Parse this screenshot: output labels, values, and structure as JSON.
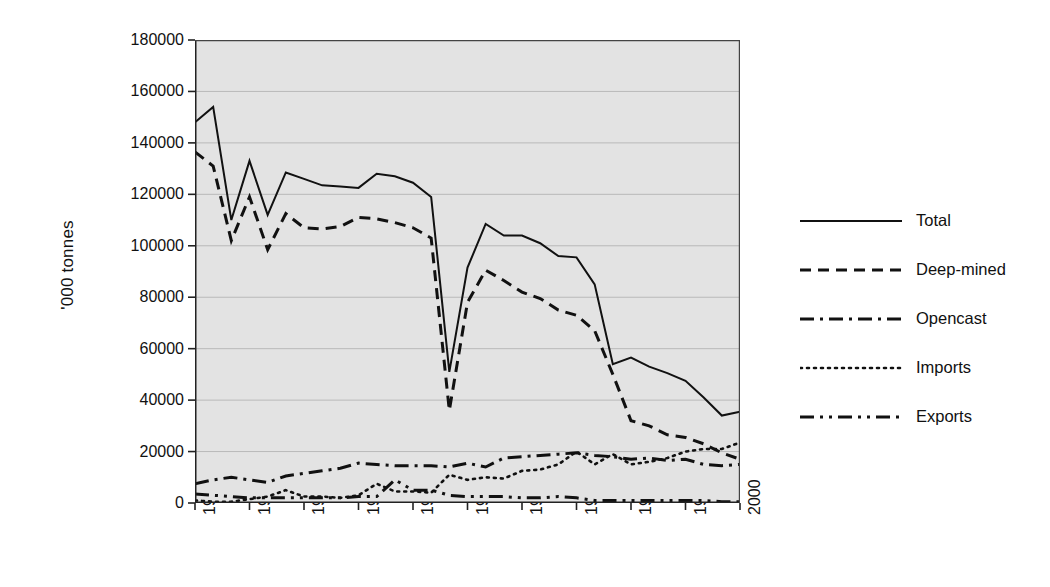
{
  "chart_data": {
    "type": "line",
    "title": "",
    "xlabel": "",
    "ylabel": "'000 tonnes",
    "ylim": [
      0,
      180000
    ],
    "xlim": [
      1970,
      2000
    ],
    "ytick_labels": [
      "180000",
      "160000",
      "140000",
      "120000",
      "100000",
      "80000",
      "60000",
      "40000",
      "20000",
      "0"
    ],
    "ytick_values": [
      180000,
      160000,
      140000,
      120000,
      100000,
      80000,
      60000,
      40000,
      20000,
      0
    ],
    "xtick_labels": [
      "1970",
      "1973",
      "1976",
      "1979",
      "1982",
      "1985",
      "1988",
      "1991",
      "1994",
      "1997",
      "2000"
    ],
    "xtick_values": [
      1970,
      1973,
      1976,
      1979,
      1982,
      1985,
      1988,
      1991,
      1994,
      1997,
      2000
    ],
    "x": [
      1970,
      1971,
      1972,
      1973,
      1974,
      1975,
      1976,
      1977,
      1978,
      1979,
      1980,
      1981,
      1982,
      1983,
      1984,
      1985,
      1986,
      1987,
      1988,
      1989,
      1990,
      1991,
      1992,
      1993,
      1994,
      1995,
      1996,
      1997,
      1998,
      1999,
      2000
    ],
    "grid": true,
    "grid_axis": "y",
    "legend_position": "right",
    "plot_background": "#e3e3e3",
    "series": [
      {
        "name": "Total",
        "style": "solid",
        "color": "#111111",
        "values": [
          148000,
          154000,
          110000,
          133000,
          112000,
          128500,
          126000,
          123500,
          123000,
          122500,
          128000,
          127000,
          124500,
          119000,
          51000,
          91500,
          108500,
          104000,
          104000,
          101000,
          96000,
          95500,
          85000,
          54000,
          56500,
          53000,
          50500,
          47500,
          41000,
          34000,
          35500
        ]
      },
      {
        "name": "Deep-mined",
        "style": "dashed",
        "color": "#111111",
        "values": [
          136500,
          131000,
          102000,
          119000,
          98500,
          112500,
          107000,
          106500,
          107500,
          111000,
          110500,
          109000,
          107000,
          103000,
          36000,
          78000,
          90500,
          86500,
          82000,
          79500,
          75000,
          73000,
          67000,
          50000,
          32000,
          30000,
          26500,
          25500,
          23000,
          19500,
          17000
        ]
      },
      {
        "name": "Opencast",
        "style": "dashdot",
        "color": "#111111",
        "values": [
          7500,
          9000,
          10000,
          9000,
          8000,
          10500,
          11500,
          12500,
          13500,
          15500,
          15000,
          14500,
          14500,
          14500,
          14000,
          15500,
          14000,
          17500,
          18000,
          18500,
          19000,
          19500,
          18500,
          18000,
          17000,
          17500,
          16500,
          17000,
          15000,
          14500,
          15000
        ]
      },
      {
        "name": "Imports",
        "style": "dotted",
        "color": "#111111",
        "values": [
          1000,
          500,
          500,
          1500,
          2500,
          5000,
          2500,
          2500,
          2000,
          3000,
          7500,
          4500,
          4500,
          4000,
          11000,
          9000,
          10000,
          9500,
          12500,
          13000,
          15000,
          20000,
          15000,
          19000,
          15000,
          16000,
          17500,
          20000,
          21000,
          21000,
          23500
        ]
      },
      {
        "name": "Exports",
        "style": "dashdotdot",
        "color": "#111111",
        "values": [
          3500,
          3000,
          2500,
          2000,
          2000,
          2000,
          2000,
          2000,
          2000,
          2500,
          2500,
          9000,
          5000,
          5000,
          3000,
          2500,
          2500,
          2500,
          2000,
          2000,
          2500,
          2000,
          1000,
          1000,
          1000,
          1000,
          1000,
          1000,
          1000,
          500,
          500
        ]
      }
    ]
  },
  "axis": {
    "ytitle": "'000 tonnes"
  },
  "legend": {
    "items": [
      {
        "label": "Total",
        "style": "solid"
      },
      {
        "label": "Deep-mined",
        "style": "dashed"
      },
      {
        "label": "Opencast",
        "style": "dashdot"
      },
      {
        "label": "Imports",
        "style": "dotted"
      },
      {
        "label": "Exports",
        "style": "dashdotdot"
      }
    ]
  }
}
